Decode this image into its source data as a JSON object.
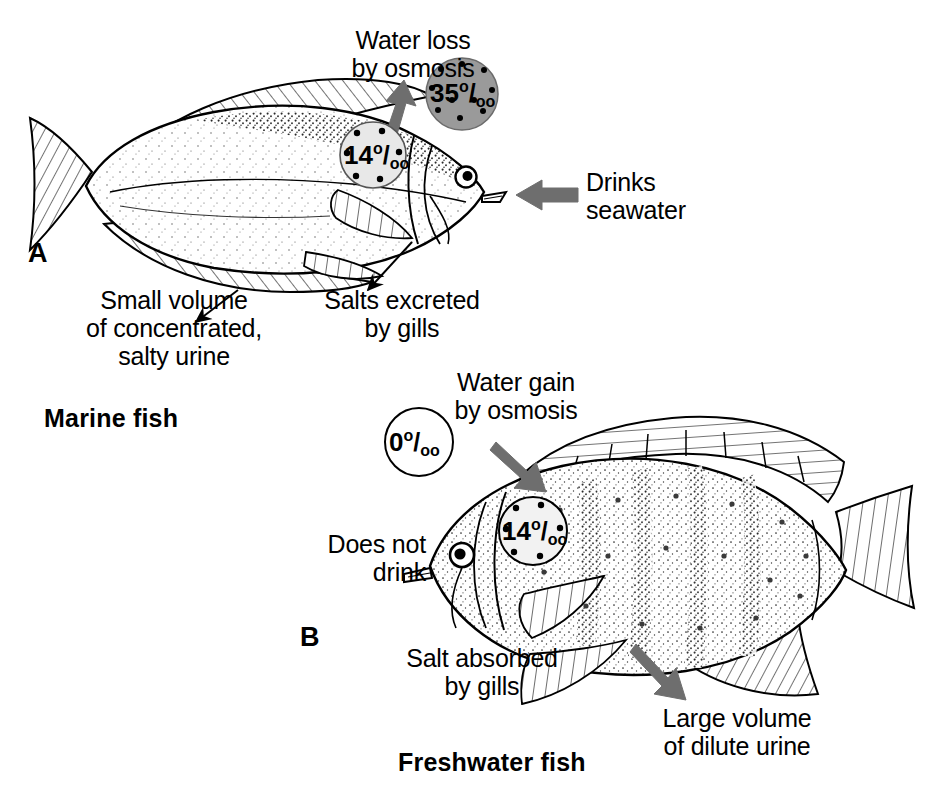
{
  "figure": {
    "width": 935,
    "height": 786,
    "background": "#ffffff",
    "ink_color": "#000000",
    "arrow_color": "#6e6e6e",
    "seawater_circle_fill": "#9a9a9a",
    "bodyfluid_circle_fill": "#e8e8e8",
    "freshwater_circle_fill": "#ffffff"
  },
  "panels": [
    {
      "letter": "A",
      "caption": "Marine fish",
      "fish_orientation": "faces-right",
      "labels": {
        "water_loss": "Water loss\nby osmosis",
        "drinks": "Drinks\nseawater",
        "urine": "Small volume\nof concentrated,\nsalty urine",
        "salts": "Salts excreted\nby gills"
      },
      "concentrations": {
        "environment": {
          "value": "35",
          "unit": "o/oo",
          "meaning": "seawater salinity parts per thousand"
        },
        "body_fluid": {
          "value": "14",
          "unit": "o/oo",
          "meaning": "body fluid parts per thousand"
        }
      }
    },
    {
      "letter": "B",
      "caption": "Freshwater fish",
      "fish_orientation": "faces-left",
      "labels": {
        "water_gain": "Water gain\nby osmosis",
        "does_not_drink": "Does not\ndrink",
        "salt": "Salt absorbed\nby gills",
        "urine": "Large volume\nof dilute urine"
      },
      "concentrations": {
        "environment": {
          "value": "0",
          "unit": "o/oo",
          "meaning": "fresh water parts per thousand"
        },
        "body_fluid": {
          "value": "14",
          "unit": "o/oo",
          "meaning": "body fluid parts per thousand"
        }
      }
    }
  ],
  "permil_parts": {
    "sup": "o",
    "slash": "/",
    "sub": "oo"
  }
}
